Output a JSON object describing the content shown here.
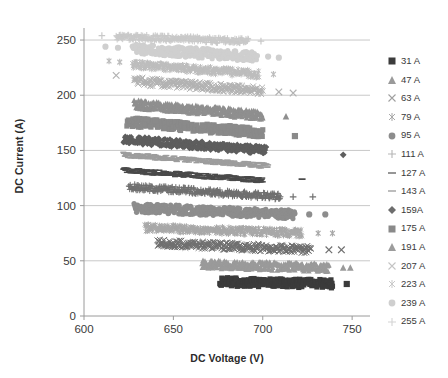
{
  "chart_data": {
    "type": "scatter",
    "title": "",
    "xlabel": "DC Voltage (V)",
    "ylabel": "DC Current (A)",
    "xlim": [
      600,
      760
    ],
    "ylim": [
      0,
      260
    ],
    "xticks": [
      600,
      650,
      700,
      750
    ],
    "yticks": [
      0,
      50,
      100,
      150,
      200,
      250
    ],
    "grid": "horizontal",
    "legend_position": "right",
    "marker_cycle": [
      "square",
      "triangle",
      "cross-x",
      "asterisk",
      "circle",
      "plus",
      "dash",
      "dash",
      "diamond"
    ],
    "series": [
      {
        "name": "31 A",
        "label": "31 A",
        "marker": "square",
        "color": "#3b3b3b",
        "band": {
          "x_start": 676,
          "y_start": 31,
          "x_end": 739,
          "y_end": 29,
          "thickness": 4.2
        },
        "outliers": [
          [
            747,
            29
          ]
        ]
      },
      {
        "name": "47 A",
        "label": "47 A",
        "marker": "triangle",
        "color": "#9a9a9a",
        "band": {
          "x_start": 666,
          "y_start": 47,
          "x_end": 737,
          "y_end": 44,
          "thickness": 4.0
        },
        "outliers": [
          [
            745,
            44
          ],
          [
            749,
            44
          ]
        ]
      },
      {
        "name": "63 A",
        "label": "63 A",
        "marker": "cross-x",
        "color": "#6f6f6f",
        "band": {
          "x_start": 641,
          "y_start": 66,
          "x_end": 727,
          "y_end": 60,
          "thickness": 3.8
        },
        "outliers": [
          [
            737,
            60
          ],
          [
            744,
            60
          ]
        ]
      },
      {
        "name": "79 A",
        "label": "79 A",
        "marker": "asterisk",
        "color": "#a8a8a8",
        "band": {
          "x_start": 634,
          "y_start": 80,
          "x_end": 722,
          "y_end": 75,
          "thickness": 3.6
        },
        "outliers": [
          [
            731,
            75
          ],
          [
            739,
            75
          ]
        ]
      },
      {
        "name": "95 A",
        "label": "95 A",
        "marker": "circle",
        "color": "#8d8d8d",
        "band": {
          "x_start": 628,
          "y_start": 98,
          "x_end": 718,
          "y_end": 92,
          "thickness": 4.4
        },
        "outliers": [
          [
            726,
            92
          ],
          [
            735,
            92
          ]
        ]
      },
      {
        "name": "111 A",
        "label": "111 A",
        "marker": "plus",
        "color": "#707070",
        "band": {
          "x_start": 625,
          "y_start": 117,
          "x_end": 710,
          "y_end": 108,
          "thickness": 3.2
        },
        "outliers": [
          [
            717,
            108
          ],
          [
            728,
            108
          ]
        ]
      },
      {
        "name": "127 A",
        "label": "127 A",
        "marker": "dash",
        "color": "#4a4a4a",
        "band": {
          "x_start": 622,
          "y_start": 132,
          "x_end": 700,
          "y_end": 123,
          "thickness": 2.6
        },
        "outliers": [
          [
            722,
            124
          ]
        ]
      },
      {
        "name": "143 A",
        "label": "143 A",
        "marker": "dash",
        "color": "#9d9d9d",
        "band": {
          "x_start": 622,
          "y_start": 146,
          "x_end": 703,
          "y_end": 136,
          "thickness": 2.6
        },
        "outliers": []
      },
      {
        "name": "159A",
        "label": "159A",
        "marker": "diamond",
        "color": "#5e5e5e",
        "band": {
          "x_start": 622,
          "y_start": 160,
          "x_end": 702,
          "y_end": 150,
          "thickness": 4.0
        },
        "outliers": [
          [
            745,
            146
          ]
        ]
      },
      {
        "name": "175 A",
        "label": "175 A",
        "marker": "square",
        "color": "#8a8a8a",
        "band": {
          "x_start": 624,
          "y_start": 176,
          "x_end": 700,
          "y_end": 166,
          "thickness": 4.4
        },
        "outliers": [
          [
            640,
            177
          ],
          [
            718,
            163
          ]
        ]
      },
      {
        "name": "191 A",
        "label": "191 A",
        "marker": "triangle",
        "color": "#8f8f8f",
        "band": {
          "x_start": 628,
          "y_start": 192,
          "x_end": 700,
          "y_end": 182,
          "thickness": 4.2
        },
        "outliers": [
          [
            634,
            194
          ],
          [
            713,
            181
          ]
        ]
      },
      {
        "name": "207 A",
        "label": "207 A",
        "marker": "cross-x",
        "color": "#b2b2b2",
        "band": {
          "x_start": 628,
          "y_start": 213,
          "x_end": 700,
          "y_end": 204,
          "thickness": 4.0
        },
        "outliers": [
          [
            618,
            218
          ],
          [
            709,
            203
          ],
          [
            717,
            202
          ]
        ]
      },
      {
        "name": "223 A",
        "label": "223 A",
        "marker": "asterisk",
        "color": "#bdbdbd",
        "band": {
          "x_start": 627,
          "y_start": 228,
          "x_end": 698,
          "y_end": 219,
          "thickness": 3.8
        },
        "outliers": [
          [
            614,
            231
          ],
          [
            620,
            230
          ],
          [
            706,
            219
          ]
        ]
      },
      {
        "name": "239 A",
        "label": "239 A",
        "marker": "circle",
        "color": "#cfcfcf",
        "band": {
          "x_start": 627,
          "y_start": 242,
          "x_end": 697,
          "y_end": 235,
          "thickness": 5.0
        },
        "outliers": [
          [
            612,
            244
          ],
          [
            619,
            243
          ],
          [
            703,
            235
          ],
          [
            709,
            234
          ]
        ]
      },
      {
        "name": "255 A",
        "label": "255 A",
        "marker": "plus",
        "color": "#c9c9c9",
        "band": {
          "x_start": 618,
          "y_start": 253,
          "x_end": 692,
          "y_end": 249,
          "thickness": 3.0
        },
        "outliers": [
          [
            610,
            254
          ],
          [
            699,
            249
          ]
        ]
      }
    ]
  },
  "axes": {
    "x_title": "DC Voltage (V)",
    "y_title": "DC Current (A)",
    "x_tick_labels": [
      "600",
      "650",
      "700",
      "750"
    ],
    "y_tick_labels": [
      "0",
      "50",
      "100",
      "150",
      "200",
      "250"
    ]
  },
  "legend": {
    "items": [
      {
        "label": "31 A",
        "marker": "square",
        "color": "#3b3b3b"
      },
      {
        "label": "47 A",
        "marker": "triangle",
        "color": "#9a9a9a"
      },
      {
        "label": "63 A",
        "marker": "cross-x",
        "color": "#9f9f9f"
      },
      {
        "label": "79 A",
        "marker": "asterisk",
        "color": "#a8a8a8"
      },
      {
        "label": "95 A",
        "marker": "circle",
        "color": "#8d8d8d"
      },
      {
        "label": "111 A",
        "marker": "plus",
        "color": "#b5b5b5"
      },
      {
        "label": "127 A",
        "marker": "dash",
        "color": "#7c7c7c"
      },
      {
        "label": "143 A",
        "marker": "dash",
        "color": "#adadad"
      },
      {
        "label": "159A",
        "marker": "diamond",
        "color": "#6d6d6d"
      },
      {
        "label": "175 A",
        "marker": "square",
        "color": "#8a8a8a"
      },
      {
        "label": "191 A",
        "marker": "triangle",
        "color": "#9c9c9c"
      },
      {
        "label": "207 A",
        "marker": "cross-x",
        "color": "#c4c4c4"
      },
      {
        "label": "223 A",
        "marker": "asterisk",
        "color": "#c9c9c9"
      },
      {
        "label": "239 A",
        "marker": "circle",
        "color": "#cfcfcf"
      },
      {
        "label": "255 A",
        "marker": "plus",
        "color": "#d4d4d4"
      }
    ]
  },
  "colors": {
    "grid": "#c8c8c8",
    "axis": "#9a9a9a",
    "text": "#3a3a3a",
    "background": "#ffffff"
  }
}
